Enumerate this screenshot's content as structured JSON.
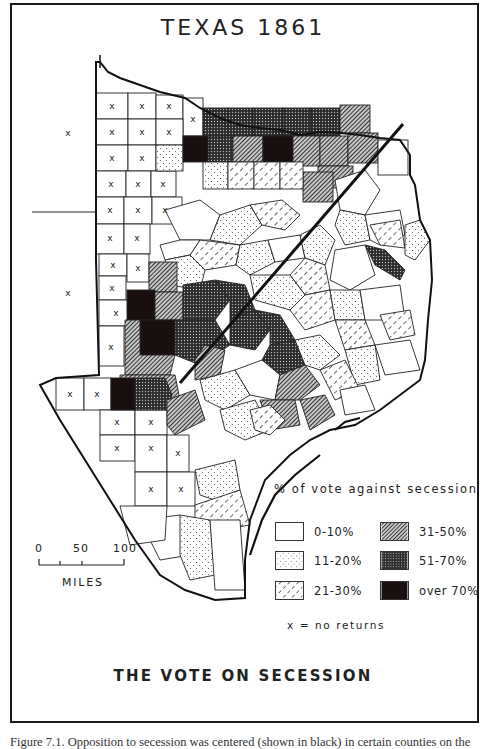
{
  "figure": {
    "title": "TEXAS 1861",
    "bottom_title": "THE VOTE ON SECESSION",
    "caption": "Figure 7.1. Opposition to secession was centered (shown in black) in certain counties on the"
  },
  "legend": {
    "title": "% of vote against secession",
    "items": [
      {
        "label": "0-10%",
        "pattern": "blank",
        "color": "#ffffff"
      },
      {
        "label": "11-20%",
        "pattern": "dots",
        "color": "#f4f4f4"
      },
      {
        "label": "21-30%",
        "pattern": "light-dash",
        "color": "#eeeeee"
      },
      {
        "label": "31-50%",
        "pattern": "diagonal-hatch",
        "color": "#8a8a8a"
      },
      {
        "label": "51-70%",
        "pattern": "crosshatch",
        "color": "#3a3a3a"
      },
      {
        "label": "over 70%",
        "pattern": "solid",
        "color": "#1a1010"
      }
    ],
    "no_returns_note": "x  =  no returns"
  },
  "scale": {
    "ticks": [
      "0",
      "50",
      "100"
    ],
    "unit": "MILES"
  },
  "map": {
    "no_return_marker": "x",
    "annotations": [
      "diagonal line marking Balcones Escarpment / division"
    ]
  }
}
